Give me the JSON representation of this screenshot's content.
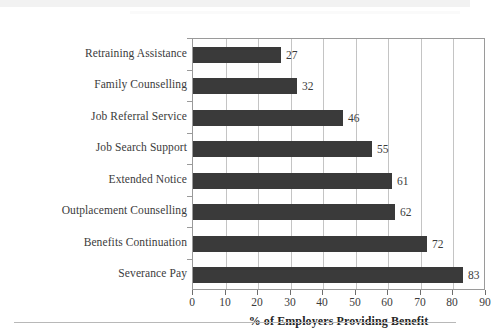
{
  "chart_data": {
    "type": "bar",
    "orientation": "horizontal",
    "title": "",
    "xlabel": "% of Employers Providing Benefit",
    "ylabel": "",
    "categories": [
      "Retraining Assistance",
      "Family Counselling",
      "Job Referral Service",
      "Job Search Support",
      "Extended Notice",
      "Outplacement Counselling",
      "Benefits Continuation",
      "Severance Pay"
    ],
    "values": [
      27,
      32,
      46,
      55,
      61,
      62,
      72,
      83
    ],
    "value_labels": [
      "27",
      "32",
      "46",
      "55",
      "61",
      "62",
      "72",
      "83"
    ],
    "xlim": [
      0,
      90
    ],
    "xticks": [
      0,
      10,
      20,
      30,
      40,
      50,
      60,
      70,
      80,
      90
    ],
    "xtick_labels": [
      "0",
      "10",
      "20",
      "30",
      "40",
      "50",
      "60",
      "70",
      "80",
      "90"
    ],
    "grid": true,
    "grid_axis": "x",
    "legend": false,
    "legend_position": "none",
    "bar_color": "#3a3a3a",
    "grid_color": "#c4c4c4",
    "frame_color": "#9a9a9a",
    "text_color": "#3b3b3b"
  }
}
